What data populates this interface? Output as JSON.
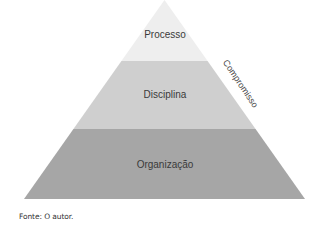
{
  "diagram": {
    "type": "pyramid",
    "layers": [
      {
        "label": "Processo",
        "color": "#eeeeee"
      },
      {
        "label": "Disciplina",
        "color": "#cfcfcf"
      },
      {
        "label": "Organização",
        "color": "#a6a6a6"
      }
    ],
    "side_label": "Compromisso"
  },
  "caption": "Fonte: O autor."
}
